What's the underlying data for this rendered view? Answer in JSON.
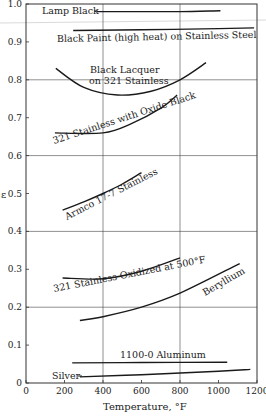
{
  "chart_data": {
    "type": "line",
    "title": "",
    "xlabel": "Temperature, °F",
    "ylabel": "ε",
    "xlim": [
      0,
      1200
    ],
    "ylim": [
      0,
      1.0
    ],
    "xticks": [
      0,
      200,
      400,
      600,
      800,
      1000,
      1200
    ],
    "xtick_labels": [
      "0",
      "200",
      "400",
      "600",
      "800",
      "1000",
      "1200"
    ],
    "yticks": [
      0,
      0.1,
      0.2,
      0.3,
      0.4,
      0.5,
      0.6,
      0.7,
      0.8,
      0.9,
      1.0
    ],
    "ytick_labels": [
      "0",
      "0.1",
      "0.2",
      "0.3",
      "0.4",
      "0.5",
      "0.6",
      "0.7",
      "0.8",
      "0.9",
      "1.0"
    ],
    "grid": {
      "x": [
        400,
        800
      ],
      "y": [
        0.2,
        0.4,
        0.6,
        0.8
      ]
    },
    "legend": "inline labels on curves",
    "series": [
      {
        "name": "Lamp Black",
        "x": [
          370,
          600,
          800,
          1010
        ],
        "y": [
          0.98,
          0.98,
          0.98,
          0.982
        ]
      },
      {
        "name": "Black Paint (high heat) on Stainless Steel",
        "x": [
          245,
          600,
          1000,
          1185
        ],
        "y": [
          0.93,
          0.932,
          0.935,
          0.937
        ]
      },
      {
        "name": "Black Lacquer on 321 Stainless",
        "x": [
          155,
          300,
          475,
          650,
          800,
          935
        ],
        "y": [
          0.83,
          0.78,
          0.76,
          0.77,
          0.8,
          0.845
        ]
      },
      {
        "name": "321 Stainless with Oxide Black",
        "x": [
          150,
          400,
          550,
          700,
          785
        ],
        "y": [
          0.66,
          0.66,
          0.685,
          0.725,
          0.76
        ]
      },
      {
        "name": "Armco 17-7 Stainless",
        "x": [
          190,
          300,
          400,
          500,
          600
        ],
        "y": [
          0.456,
          0.478,
          0.5,
          0.525,
          0.555
        ]
      },
      {
        "name": "321 Stainless Oxidized at 500°F",
        "x": [
          190,
          400,
          600,
          800
        ],
        "y": [
          0.277,
          0.275,
          0.295,
          0.33
        ]
      },
      {
        "name": "Beryllium",
        "x": [
          280,
          400,
          600,
          800,
          1110
        ],
        "y": [
          0.165,
          0.175,
          0.2,
          0.237,
          0.315
        ]
      },
      {
        "name": "1100-0 Aluminum",
        "x": [
          240,
          600,
          1045
        ],
        "y": [
          0.053,
          0.054,
          0.055
        ]
      },
      {
        "name": "Silver",
        "x": [
          280,
          600,
          1000,
          1165
        ],
        "y": [
          0.016,
          0.022,
          0.031,
          0.036
        ]
      }
    ],
    "labels": {
      "lamp_black": "Lamp Black",
      "black_paint": "Black Paint (high heat) on Stainless Steel",
      "black_lacquer_1": "Black Lacquer",
      "black_lacquer_2": "on 321 Stainless",
      "oxide_black": "321 Stainless with Oxide Black",
      "armco": "Armco 17-7 Stainless",
      "oxidized_500": "321 Stainless Oxidized at 500°F",
      "beryllium": "Beryllium",
      "aluminum": "1100-0 Aluminum",
      "silver": "Silver"
    }
  }
}
